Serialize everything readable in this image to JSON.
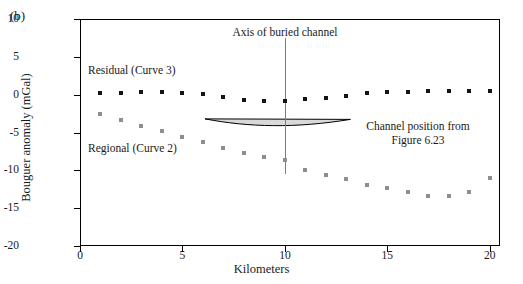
{
  "figure": {
    "panel_label": "(b)",
    "xlabel": "Kilometers",
    "ylabel": "Bouguer anomaly (mGal)"
  },
  "annotations": {
    "axis_of_channel": "Axis of buried channel",
    "channel_position_line1": "Channel position from",
    "channel_position_line2": "Figure 6.23",
    "residual_label": "Residual (Curve 3)",
    "regional_label": "Regional (Curve 2)"
  },
  "colors": {
    "residual": "#141414",
    "regional": "#8e8e8e",
    "axis_line": "#7d7d7d",
    "frame": "#000000",
    "lens_fill": "#d9d9d9"
  },
  "chart_data": {
    "type": "scatter",
    "title": "",
    "xlabel": "Kilometers",
    "ylabel": "Bouguer anomaly (mGal)",
    "xlim": [
      0,
      20.5
    ],
    "ylim": [
      -20,
      10
    ],
    "xticks": [
      0,
      5,
      10,
      15,
      20
    ],
    "yticks": [
      10,
      5,
      0,
      -5,
      -10,
      -15,
      -20
    ],
    "grid": false,
    "legend": "inline-labels",
    "x": [
      1,
      2,
      3,
      4,
      5,
      6,
      7,
      8,
      9,
      10,
      11,
      12,
      13,
      14,
      15,
      16,
      17,
      18,
      19,
      20
    ],
    "series": [
      {
        "name": "Residual (Curve 3)",
        "marker": "square",
        "color": "#141414",
        "values": [
          0.2,
          0.2,
          0.3,
          0.3,
          0.2,
          0.1,
          -0.3,
          -0.7,
          -0.9,
          -0.9,
          -0.6,
          -0.5,
          -0.2,
          0.2,
          0.4,
          0.4,
          0.5,
          0.5,
          0.5,
          0.5
        ]
      },
      {
        "name": "Regional (Curve 2)",
        "marker": "square",
        "color": "#8e8e8e",
        "values": [
          -2.6,
          -3.4,
          -4.2,
          -4.8,
          -5.6,
          -6.3,
          -7.0,
          -7.7,
          -8.3,
          -8.6,
          -9.9,
          -10.6,
          -11.2,
          -11.9,
          -12.4,
          -12.9,
          -13.4,
          -13.4,
          -12.9,
          -11.0
        ]
      }
    ],
    "shapes": [
      {
        "name": "buried-channel-lens",
        "x_range": [
          6.1,
          13.2
        ],
        "y_top": -3.2,
        "y_bottom_max": -4.3,
        "fill": "#d9d9d9"
      },
      {
        "name": "channel-axis-vline",
        "x": 10,
        "y_range": [
          7.5,
          -10.5
        ]
      }
    ]
  }
}
